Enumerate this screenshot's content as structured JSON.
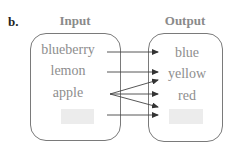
{
  "figure": {
    "part_label": "b.",
    "input": {
      "header": "Input",
      "items": [
        "blueberry",
        "lemon",
        "apple",
        ""
      ]
    },
    "output": {
      "header": "Output",
      "items": [
        "blue",
        "yellow",
        "red",
        ""
      ]
    },
    "mappings": [
      {
        "from": "blueberry",
        "to": "blue"
      },
      {
        "from": "lemon",
        "to": "yellow"
      },
      {
        "from": "apple",
        "to": "yellow"
      },
      {
        "from": "apple",
        "to": "red"
      },
      {
        "from": "apple",
        "to": "(blank)"
      },
      {
        "from": "(blank)",
        "to": "(blank)"
      }
    ],
    "colors": {
      "text": "#8e8e8e",
      "border": "#7a7a7a",
      "arrow": "#333333",
      "blank_fill": "#ececec"
    }
  }
}
